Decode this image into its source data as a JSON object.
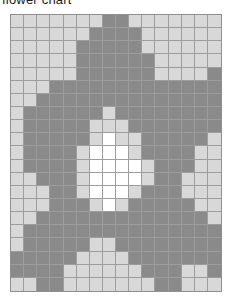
{
  "title": "flower chart",
  "colors": {
    "background_cell": "#d8d8d8",
    "petal_cell": "#8a8a8a",
    "center_cell": "#ffffff",
    "gridline": "#9d9d9d",
    "border": "#8f8f8f",
    "page_background": "#ffffff",
    "title_text": "#1a1a1a"
  },
  "chart_data": {
    "type": "heatmap",
    "title": "flower chart",
    "subtitle": "",
    "xlabel": "",
    "ylabel": "",
    "columns": 16,
    "rows": 21,
    "grid": true,
    "legend": "none",
    "value_labels": {
      "0": "background",
      "1": "petal",
      "2": "center"
    },
    "palette": [
      "#d8d8d8",
      "#8a8a8a",
      "#ffffff"
    ],
    "xticklabels": [],
    "yticklabels": [],
    "values": [
      [
        0,
        0,
        0,
        0,
        0,
        0,
        0,
        1,
        1,
        0,
        0,
        0,
        0,
        0,
        0,
        0
      ],
      [
        0,
        0,
        0,
        0,
        0,
        0,
        1,
        1,
        1,
        1,
        0,
        0,
        0,
        0,
        0,
        0
      ],
      [
        0,
        0,
        0,
        0,
        0,
        1,
        1,
        1,
        1,
        1,
        0,
        0,
        0,
        0,
        0,
        0
      ],
      [
        0,
        0,
        0,
        0,
        0,
        1,
        1,
        1,
        1,
        1,
        1,
        0,
        0,
        0,
        0,
        0
      ],
      [
        0,
        0,
        0,
        0,
        0,
        1,
        1,
        1,
        1,
        1,
        1,
        0,
        0,
        0,
        0,
        1
      ],
      [
        0,
        0,
        0,
        1,
        1,
        1,
        1,
        1,
        1,
        1,
        1,
        1,
        1,
        1,
        1,
        1
      ],
      [
        0,
        0,
        1,
        1,
        1,
        1,
        1,
        1,
        1,
        1,
        1,
        1,
        1,
        1,
        1,
        1
      ],
      [
        0,
        1,
        1,
        1,
        1,
        1,
        1,
        0,
        1,
        1,
        1,
        1,
        1,
        1,
        1,
        1
      ],
      [
        0,
        1,
        1,
        1,
        1,
        1,
        0,
        0,
        0,
        1,
        1,
        1,
        1,
        1,
        1,
        1
      ],
      [
        0,
        1,
        1,
        1,
        1,
        1,
        0,
        2,
        0,
        0,
        1,
        1,
        1,
        1,
        1,
        0
      ],
      [
        0,
        1,
        1,
        1,
        1,
        0,
        2,
        2,
        2,
        0,
        1,
        1,
        1,
        1,
        0,
        0
      ],
      [
        0,
        1,
        1,
        1,
        1,
        0,
        2,
        2,
        2,
        2,
        0,
        1,
        1,
        1,
        0,
        0
      ],
      [
        0,
        0,
        1,
        1,
        1,
        0,
        2,
        2,
        2,
        2,
        0,
        1,
        1,
        0,
        0,
        0
      ],
      [
        0,
        0,
        0,
        1,
        1,
        0,
        2,
        2,
        2,
        0,
        1,
        1,
        1,
        0,
        0,
        0
      ],
      [
        0,
        0,
        0,
        1,
        1,
        1,
        0,
        2,
        0,
        1,
        1,
        1,
        1,
        1,
        0,
        0
      ],
      [
        0,
        0,
        1,
        1,
        1,
        1,
        1,
        1,
        1,
        1,
        1,
        1,
        1,
        1,
        1,
        0
      ],
      [
        0,
        1,
        1,
        1,
        1,
        1,
        1,
        1,
        1,
        1,
        1,
        1,
        1,
        1,
        1,
        1
      ],
      [
        0,
        1,
        1,
        1,
        1,
        1,
        0,
        0,
        1,
        1,
        1,
        1,
        1,
        1,
        1,
        1
      ],
      [
        1,
        1,
        1,
        1,
        1,
        0,
        0,
        0,
        0,
        1,
        1,
        1,
        1,
        1,
        1,
        1
      ],
      [
        1,
        1,
        1,
        1,
        0,
        0,
        0,
        0,
        0,
        0,
        1,
        1,
        1,
        0,
        0,
        1
      ],
      [
        0,
        0,
        1,
        1,
        0,
        0,
        0,
        0,
        0,
        0,
        0,
        1,
        1,
        0,
        0,
        0
      ]
    ]
  }
}
